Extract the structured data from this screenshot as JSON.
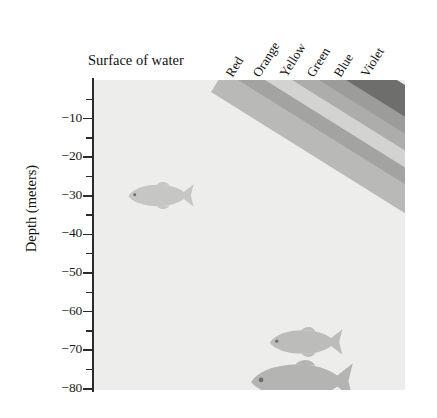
{
  "figure": {
    "surface_label": "Surface of water",
    "y_axis_title": "Depth (meters)",
    "background_color": "#ededeb",
    "axis_color": "#2a2a2a"
  },
  "axis": {
    "major_ticks": [
      {
        "label": "−10",
        "value": -10
      },
      {
        "label": "−20",
        "value": -20
      },
      {
        "label": "−30",
        "value": -30
      },
      {
        "label": "−40",
        "value": -40
      },
      {
        "label": "−50",
        "value": -50
      },
      {
        "label": "−60",
        "value": -60
      },
      {
        "label": "−70",
        "value": -70
      },
      {
        "label": "−80",
        "value": -80
      }
    ],
    "minor_tick_values": [
      -5,
      -15,
      -25,
      -35,
      -45,
      -55,
      -65,
      -75
    ],
    "range": [
      0,
      -83
    ]
  },
  "bands": [
    {
      "name": "Red",
      "label": "Red",
      "color": "#b9b9b7",
      "top_depth": -3,
      "bottom_depth": -58
    },
    {
      "name": "Orange",
      "label": "Orange",
      "color": "#a3a3a1",
      "top_depth": 0,
      "bottom_depth": -76
    },
    {
      "name": "Yellow",
      "label": "Yellow",
      "color": "#d3d3d1",
      "top_depth": 0,
      "bottom_depth": -82
    },
    {
      "name": "Green",
      "label": "Green",
      "color": "#adadab",
      "top_depth": 0,
      "bottom_depth": -46
    },
    {
      "name": "Blue",
      "label": "Blue",
      "color": "#9c9c9a",
      "top_depth": 0,
      "bottom_depth": -40
    },
    {
      "name": "Violet",
      "label": "Violet",
      "color": "#6e6e6c",
      "top_depth": 0,
      "bottom_depth": -44
    }
  ],
  "fish": [
    {
      "id": "fish-upper",
      "depth": -30,
      "size": "small"
    },
    {
      "id": "fish-middle",
      "depth": -68,
      "size": "medium"
    },
    {
      "id": "fish-lower",
      "depth": -78,
      "size": "large"
    }
  ],
  "chart_data": {
    "type": "area",
    "xlabel": "",
    "ylabel": "Depth (meters)",
    "ylim": [
      -83,
      0
    ],
    "grid": false,
    "legend": "top-rotated-labels",
    "categories": [
      "Red",
      "Orange",
      "Yellow",
      "Green",
      "Blue",
      "Violet"
    ],
    "series": [
      {
        "name": "Red",
        "max_penetration_depth": -58,
        "shade": "#b9b9b7"
      },
      {
        "name": "Orange",
        "max_penetration_depth": -76,
        "shade": "#a3a3a1"
      },
      {
        "name": "Yellow",
        "max_penetration_depth": -82,
        "shade": "#d3d3d1"
      },
      {
        "name": "Green",
        "max_penetration_depth": -46,
        "shade": "#adadab"
      },
      {
        "name": "Blue",
        "max_penetration_depth": -40,
        "shade": "#9c9c9a"
      },
      {
        "name": "Violet",
        "max_penetration_depth": -44,
        "shade": "#6e6e6c"
      }
    ],
    "annotations": [
      "Surface of water"
    ]
  }
}
